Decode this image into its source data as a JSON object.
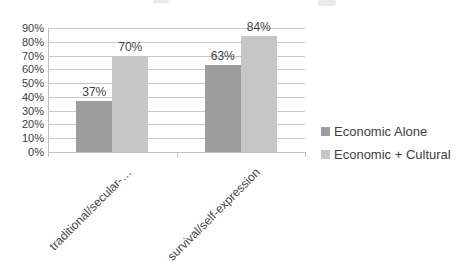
{
  "chart_data": {
    "type": "bar",
    "title": "",
    "categories": [
      "traditional/secular-…",
      "survival/self-expression"
    ],
    "series": [
      {
        "name": "Economic Alone",
        "color": "#9d9d9d",
        "values": [
          37,
          63
        ],
        "labels": [
          "37%",
          "63%"
        ]
      },
      {
        "name": "Economic + Cultural",
        "color": "#c6c6c6",
        "values": [
          70,
          84
        ],
        "labels": [
          "70%",
          "84%"
        ]
      }
    ],
    "y_ticks": [
      "0%",
      "10%",
      "20%",
      "30%",
      "40%",
      "50%",
      "60%",
      "70%",
      "80%",
      "90%"
    ],
    "ylim": [
      0,
      90
    ],
    "grid": true,
    "legend_position": "right",
    "xlabel": "",
    "ylabel": ""
  },
  "colors": {
    "grid": "#c9c9c9",
    "axis": "#bfbfbf",
    "text": "#404040",
    "background": "#ffffff"
  }
}
